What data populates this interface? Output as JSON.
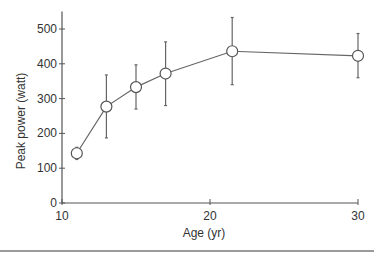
{
  "chart_data": {
    "type": "line",
    "title": "",
    "xlabel": "Age (yr)",
    "ylabel": "Peak power (watt)",
    "xlim": [
      10,
      30
    ],
    "ylim": [
      0,
      550
    ],
    "x_ticks": [
      10,
      20,
      30
    ],
    "y_ticks": [
      0,
      100,
      200,
      300,
      400,
      500
    ],
    "grid": false,
    "legend": null,
    "marker": "open-circle",
    "series": [
      {
        "name": "Peak power",
        "x": [
          11,
          13,
          15,
          17,
          21.5,
          30
        ],
        "values": [
          143,
          277,
          333,
          372,
          436,
          423
        ],
        "error_low": [
          125,
          187,
          270,
          280,
          340,
          360
        ],
        "error_high": [
          160,
          368,
          397,
          463,
          533,
          487
        ]
      }
    ]
  }
}
